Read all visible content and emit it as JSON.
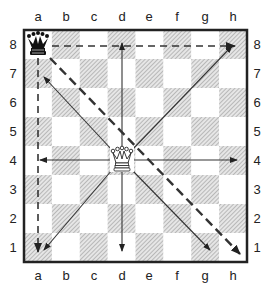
{
  "diagram": {
    "files": [
      "a",
      "b",
      "c",
      "d",
      "e",
      "f",
      "g",
      "h"
    ],
    "ranks": [
      "8",
      "7",
      "6",
      "5",
      "4",
      "3",
      "2",
      "1"
    ],
    "pieces": [
      {
        "piece": "queen",
        "color": "black",
        "square": "a8"
      },
      {
        "piece": "queen",
        "color": "white",
        "square": "d4"
      }
    ],
    "arrows_solid_from_d4": [
      "d8",
      "h8",
      "h4",
      "g1",
      "d1",
      "a1",
      "a4",
      "a7"
    ],
    "arrows_dashed_from_a8": [
      "h8",
      "a1",
      "h1"
    ],
    "colors": {
      "border": "#222222",
      "dark_square_hatch": "#9a9a9a",
      "arrow": "#333333"
    }
  }
}
